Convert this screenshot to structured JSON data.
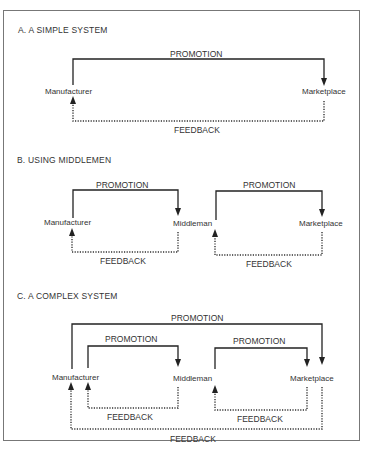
{
  "sections": [
    {
      "title": "A.  A SIMPLE SYSTEM",
      "promotion": [
        "PROMOTION"
      ],
      "feedback": [
        "FEEDBACK"
      ],
      "nodes": [
        "Manufacturer",
        "Marketplace"
      ]
    },
    {
      "title": "B.  USING MIDDLEMEN",
      "promotion": [
        "PROMOTION",
        "PROMOTION"
      ],
      "feedback": [
        "FEEDBACK",
        "FEEDBACK"
      ],
      "nodes": [
        "Manufacturer",
        "Middleman",
        "Middleman",
        "Marketplace"
      ]
    },
    {
      "title": "C.  A COMPLEX SYSTEM",
      "promotion": [
        "PROMOTION",
        "PROMOTION",
        "PROMOTION"
      ],
      "feedback": [
        "FEEDBACK",
        "FEEDBACK",
        "FEEDBACK"
      ],
      "nodes": [
        "Manufacturer",
        "Middleman",
        "Marketplace"
      ]
    }
  ]
}
